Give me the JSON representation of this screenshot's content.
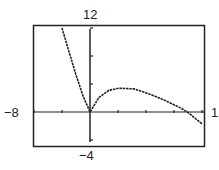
{
  "chart_data": {
    "type": "line",
    "title": "",
    "xlabel": "",
    "ylabel": "",
    "xlim": [
      -8,
      16
    ],
    "ylim": [
      -4,
      12
    ],
    "x_tick_step": 4,
    "y_tick_step": 4,
    "grid": false,
    "window_labels": {
      "xmin": "-8",
      "xmax": "1",
      "ymin": "-4",
      "ymax": "12"
    },
    "series": [
      {
        "name": "f(x)",
        "x": [
          -4.0,
          -3.0,
          -2.0,
          -1.0,
          0.0,
          1.3,
          2.7,
          4.1,
          6.3,
          8.4,
          10.6,
          12.7,
          13.9,
          16.0
        ],
        "y": [
          12.0,
          8.6,
          5.3,
          2.3,
          0.0,
          2.1,
          3.1,
          3.4,
          3.3,
          2.6,
          1.7,
          0.7,
          0.0,
          -1.7
        ]
      }
    ]
  }
}
